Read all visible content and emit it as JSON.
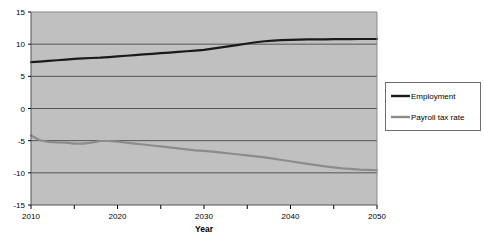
{
  "chart_data": {
    "type": "line",
    "title": "",
    "subtitle": "",
    "xlabel": "Year",
    "ylabel": "",
    "xlim": [
      2010,
      2050
    ],
    "ylim": [
      -15,
      15
    ],
    "grid": true,
    "grid_axis": "y",
    "legend_position": "right",
    "plot_background": "#c0c0c0",
    "x_tick_labels": [
      "2010",
      "2020",
      "2030",
      "2040",
      "2050"
    ],
    "x_tick_values": [
      2010,
      2020,
      2030,
      2040,
      2050
    ],
    "x_minor_tick_values": [
      2015,
      2025,
      2035,
      2045
    ],
    "y_tick_labels": [
      "15",
      "10",
      "5",
      "0",
      "-5",
      "-10",
      "-15"
    ],
    "y_tick_values": [
      15,
      10,
      5,
      0,
      -5,
      -10,
      -15
    ],
    "x": [
      2010,
      2011,
      2012,
      2013,
      2014,
      2015,
      2016,
      2017,
      2018,
      2019,
      2020,
      2021,
      2022,
      2023,
      2024,
      2025,
      2026,
      2027,
      2028,
      2029,
      2030,
      2031,
      2032,
      2033,
      2034,
      2035,
      2036,
      2037,
      2038,
      2039,
      2040,
      2041,
      2042,
      2043,
      2044,
      2045,
      2046,
      2047,
      2048,
      2049,
      2050
    ],
    "series": [
      {
        "name": "Employment",
        "color": "#1a1a1a",
        "width": 2.2,
        "values": [
          7.2,
          7.3,
          7.4,
          7.5,
          7.6,
          7.7,
          7.8,
          7.85,
          7.9,
          8.0,
          8.1,
          8.2,
          8.3,
          8.4,
          8.5,
          8.6,
          8.7,
          8.8,
          8.9,
          9.0,
          9.1,
          9.3,
          9.5,
          9.7,
          9.9,
          10.1,
          10.3,
          10.45,
          10.55,
          10.62,
          10.68,
          10.72,
          10.74,
          10.75,
          10.76,
          10.77,
          10.78,
          10.79,
          10.8,
          10.8,
          10.8
        ]
      },
      {
        "name": "Payroll tax rate",
        "color": "#8c8c8c",
        "width": 2.2,
        "values": [
          -4.2,
          -4.9,
          -5.2,
          -5.25,
          -5.3,
          -5.45,
          -5.45,
          -5.3,
          -5.05,
          -5.05,
          -5.15,
          -5.3,
          -5.45,
          -5.6,
          -5.75,
          -5.9,
          -6.05,
          -6.2,
          -6.35,
          -6.5,
          -6.6,
          -6.7,
          -6.85,
          -7.0,
          -7.15,
          -7.3,
          -7.45,
          -7.6,
          -7.8,
          -8.0,
          -8.2,
          -8.4,
          -8.6,
          -8.8,
          -9.0,
          -9.15,
          -9.3,
          -9.4,
          -9.5,
          -9.55,
          -9.6
        ]
      }
    ],
    "legend": [
      {
        "label": "Employment",
        "color": "#1a1a1a"
      },
      {
        "label": "Payroll tax rate",
        "color": "#8c8c8c"
      }
    ]
  }
}
